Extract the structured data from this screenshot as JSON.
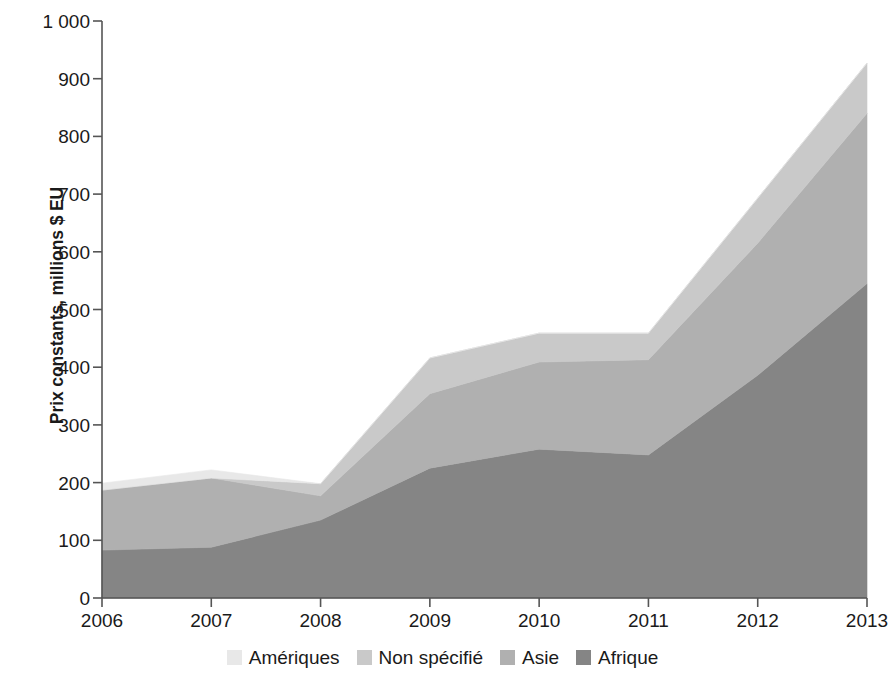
{
  "chart_data": {
    "type": "area",
    "stacked": true,
    "title": "",
    "subtitle": "",
    "xlabel": "",
    "ylabel": "Prix constants, millions $ EU",
    "categories": [
      "2006",
      "2007",
      "2008",
      "2009",
      "2010",
      "2011",
      "2012",
      "2013"
    ],
    "x": [
      2006,
      2007,
      2008,
      2009,
      2010,
      2011,
      2012,
      2013
    ],
    "xlim": [
      2006,
      2013
    ],
    "ylim": [
      0,
      1000
    ],
    "ytick_labels": [
      "0",
      "100",
      "200",
      "300",
      "400",
      "500",
      "600",
      "700",
      "800",
      "900",
      "1 000"
    ],
    "ytick_values": [
      0,
      100,
      200,
      300,
      400,
      500,
      600,
      700,
      800,
      900,
      1000
    ],
    "grid": false,
    "legend_position": "bottom",
    "stack_order_bottom_to_top": [
      "Afrique",
      "Asie",
      "Non spécifié",
      "Amériques"
    ],
    "series": [
      {
        "name": "Afrique",
        "color": "#858585",
        "values": [
          83,
          88,
          135,
          225,
          258,
          248,
          386,
          545
        ]
      },
      {
        "name": "Asie",
        "color": "#b0b0b0",
        "values": [
          104,
          120,
          42,
          129,
          151,
          165,
          229,
          295
        ]
      },
      {
        "name": "Non spécifié",
        "color": "#c9c9c9",
        "values": [
          0,
          0,
          21,
          62,
          50,
          46,
          78,
          87
        ]
      },
      {
        "name": "Amériques",
        "color": "#e8e8e8",
        "values": [
          12,
          14,
          0,
          0,
          0,
          0,
          0,
          0
        ]
      }
    ],
    "cumulative_totals": [
      199,
      222,
      198,
      416,
      459,
      459,
      693,
      927
    ]
  },
  "axes": {
    "y_title": "Prix constants, millions $ EU",
    "y_ticks": [
      {
        "label": "1 000",
        "value": 1000
      },
      {
        "label": "900",
        "value": 900
      },
      {
        "label": "800",
        "value": 800
      },
      {
        "label": "700",
        "value": 700
      },
      {
        "label": "600",
        "value": 600
      },
      {
        "label": "500",
        "value": 500
      },
      {
        "label": "400",
        "value": 400
      },
      {
        "label": "300",
        "value": 300
      },
      {
        "label": "200",
        "value": 200
      },
      {
        "label": "100",
        "value": 100
      },
      {
        "label": "0",
        "value": 0
      }
    ],
    "x_ticks": [
      {
        "label": "2006",
        "value": 2006
      },
      {
        "label": "2007",
        "value": 2007
      },
      {
        "label": "2008",
        "value": 2008
      },
      {
        "label": "2009",
        "value": 2009
      },
      {
        "label": "2010",
        "value": 2010
      },
      {
        "label": "2011",
        "value": 2011
      },
      {
        "label": "2012",
        "value": 2012
      },
      {
        "label": "2013",
        "value": 2013
      }
    ],
    "axis_color": "#555555"
  },
  "legend": {
    "items": [
      {
        "label": "Amériques",
        "color": "#e8e8e8"
      },
      {
        "label": "Non spécifié",
        "color": "#c9c9c9"
      },
      {
        "label": "Asie",
        "color": "#b0b0b0"
      },
      {
        "label": "Afrique",
        "color": "#858585"
      }
    ]
  }
}
